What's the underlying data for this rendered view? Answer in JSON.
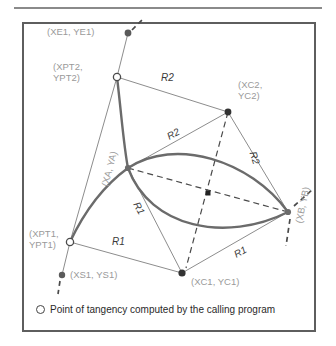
{
  "figure": {
    "type": "geometry-diagram",
    "legend": {
      "marker": "open-circle",
      "text": "Point of tangency computed by the calling program"
    },
    "points": [
      {
        "id": "XE1YE1",
        "label": "(XE1, YE1)",
        "marker": "filled-dot",
        "x": 128,
        "y": 33
      },
      {
        "id": "XPT2YPT2",
        "label": "(XPT2,\nYPT2)",
        "marker": "open-circle",
        "x": 117,
        "y": 77
      },
      {
        "id": "XC2YC2",
        "label": "(XC2,\nYC2)",
        "marker": "filled-dot",
        "x": 228,
        "y": 112
      },
      {
        "id": "XAYA",
        "label": "(XA, YA)",
        "marker": "filled-dot",
        "x": 128,
        "y": 168
      },
      {
        "id": "XBYB",
        "label": "(XB, YB)",
        "marker": "filled-dot",
        "x": 288,
        "y": 212
      },
      {
        "id": "XPT1YPT1",
        "label": "(XPT1,\nYPT1)",
        "marker": "open-circle",
        "x": 70,
        "y": 242
      },
      {
        "id": "XS1YS1",
        "label": "(XS1, YS1)",
        "marker": "filled-dot",
        "x": 62,
        "y": 275
      },
      {
        "id": "XC1YC1",
        "label": "(XC1, YC1)",
        "marker": "filled-dot",
        "x": 182,
        "y": 273
      },
      {
        "id": "CENTER",
        "label": "",
        "marker": "small-dot",
        "x": 208,
        "y": 193
      }
    ],
    "radius_labels": [
      {
        "text": "R2",
        "x": 168,
        "y": 79,
        "rotation": 0
      },
      {
        "text": "R2",
        "x": 172,
        "y": 138,
        "rotation": -28
      },
      {
        "text": "R2",
        "x": 262,
        "y": 158,
        "rotation": 72
      },
      {
        "text": "R1",
        "x": 145,
        "y": 208,
        "rotation": 62
      },
      {
        "text": "R1",
        "x": 118,
        "y": 243,
        "rotation": 0
      },
      {
        "text": "R1",
        "x": 238,
        "y": 255,
        "rotation": -28
      }
    ],
    "colors": {
      "label_gray": "#9a9a9a",
      "radius_text": "#3a3a3a",
      "frame": "#5e5e5e",
      "rule": "#8a8a8a",
      "arc": "#6b6b6b",
      "thin_line": "#8d8d8d",
      "dashed": "#4a4a4a",
      "background": "#ffffff"
    }
  }
}
